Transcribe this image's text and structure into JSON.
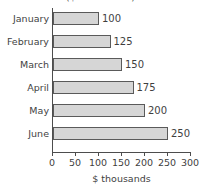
{
  "chart_data": {
    "type": "bar",
    "orientation": "horizontal",
    "title": "($ thousands)",
    "xlabel": "$ thousands",
    "ylabel": "",
    "categories": [
      "January",
      "February",
      "March",
      "April",
      "May",
      "June"
    ],
    "values": [
      100,
      125,
      150,
      175,
      200,
      250
    ],
    "value_labels": [
      "100",
      "125",
      "150",
      "175",
      "200",
      "250"
    ],
    "xlim": [
      0,
      300
    ],
    "xticks": [
      0,
      50,
      100,
      150,
      200,
      250,
      300
    ],
    "xtick_labels": [
      "0",
      "50",
      "100",
      "150",
      "200",
      "250",
      "300"
    ],
    "grid": false,
    "legend": null,
    "series": [
      {
        "name": "",
        "values": [
          100,
          125,
          150,
          175,
          200,
          250
        ]
      }
    ],
    "colors": {
      "bar_fill": "#d6d6d6",
      "bar_border": "#5a5a5a",
      "axis": "#4d4d4d",
      "text": "#3f3f3f",
      "background": "#ffffff"
    }
  }
}
